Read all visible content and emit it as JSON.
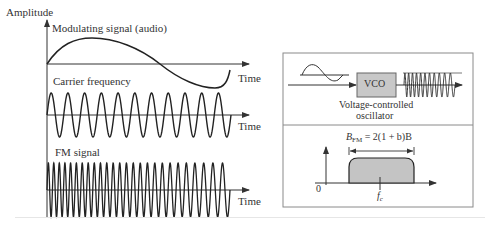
{
  "left_panel": {
    "y_axis_label": "Amplitude",
    "modulating": {
      "label": "Modulating signal (audio)",
      "time_label": "Time"
    },
    "carrier": {
      "label": "Carrier frequency",
      "time_label": "Time"
    },
    "fm": {
      "label": "FM signal",
      "time_label": "Time"
    }
  },
  "right_panel": {
    "vco": {
      "box_label": "VCO",
      "caption_line1": "Voltage-controlled",
      "caption_line2": "oscillator"
    },
    "spectrum": {
      "bandwidth_B": "B",
      "bandwidth_sub": "FM",
      "bandwidth_formula": " = 2(1 + b)B",
      "origin_label": "0",
      "center_label": "f",
      "center_sub": "c"
    }
  },
  "colors": {
    "line": "#2a2a2a",
    "vco_fill": "#c8c8c8",
    "band_fill": "#c4c4c4",
    "box_border": "#8a8a8a"
  }
}
